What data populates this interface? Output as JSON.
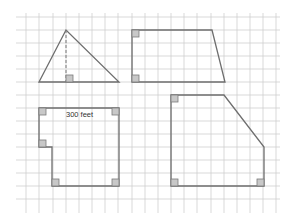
{
  "figure": {
    "colors": {
      "background": "#ffffff",
      "grid": "#cfcfcf",
      "outline": "#6e6e6e",
      "right_angle_fill": "#c8c8c8"
    },
    "grid": {
      "x_lines": [
        26,
        39,
        53,
        66,
        79,
        92,
        105,
        118,
        132,
        145,
        158,
        171,
        184,
        197,
        211,
        224,
        237,
        250,
        263,
        276
      ],
      "y_lines": [
        17,
        30,
        43,
        56,
        69,
        82,
        95,
        108,
        121,
        134,
        147,
        160,
        173,
        186,
        199
      ],
      "x_start": 16,
      "x_end": 280,
      "y_start": 17,
      "y_end": 205
    },
    "shapes": [
      {
        "name": "triangle",
        "points": "39,82 66,30 119,82",
        "altitude": {
          "x1": 66,
          "y1": 30,
          "x2": 66,
          "y2": 82
        },
        "right_angles": [
          {
            "x": 66,
            "y": 75
          }
        ]
      },
      {
        "name": "trapezoid",
        "points": "132,30 212,30 225,82 132,82",
        "right_angles": [
          {
            "x": 132,
            "y": 30
          },
          {
            "x": 132,
            "y": 75
          }
        ]
      },
      {
        "name": "notched-rectangle",
        "points": "39,108 119,108 119,186 52,186 52,147 39,147",
        "label": "300 feet",
        "right_angles": [
          {
            "x": 39,
            "y": 108
          },
          {
            "x": 112,
            "y": 108
          },
          {
            "x": 39,
            "y": 140
          },
          {
            "x": 52,
            "y": 179
          },
          {
            "x": 112,
            "y": 179
          }
        ]
      },
      {
        "name": "pentagon",
        "points": "171,95 224,95 264,147 264,186 171,186",
        "right_angles": [
          {
            "x": 171,
            "y": 95
          },
          {
            "x": 171,
            "y": 179
          },
          {
            "x": 257,
            "y": 179
          }
        ]
      }
    ]
  }
}
